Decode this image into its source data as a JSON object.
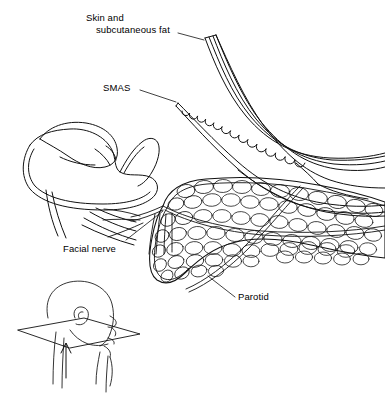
{
  "figure": {
    "background_color": "#ffffff",
    "line_color": "#000000",
    "style": "line-art medical illustration",
    "width": 385,
    "height": 399
  },
  "labels": {
    "skin_line1": "Skin and",
    "skin_line2": "subcutaneous fat",
    "smas": "SMAS",
    "facial_nerve": "Facial nerve",
    "parotid": "Parotid"
  },
  "structures": {
    "skin_flap": "skin-and-subcutaneous-fat-flap",
    "smas_layer": "smas-layer-with-fat-globules",
    "parotid_gland": "parotid-gland-lobules",
    "facial_nerve_branches": "facial-nerve-branches",
    "mandible": "mandible-ramus",
    "inset_head": "orientation-inset-head-with-section-plane",
    "inset_arrow": "view-direction-arrow"
  }
}
